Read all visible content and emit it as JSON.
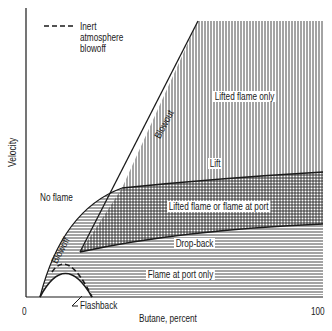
{
  "diagram": {
    "type": "stability-diagram",
    "x_axis": {
      "label": "Butane, percent",
      "min_label": "0",
      "max_label": "100"
    },
    "y_axis": {
      "label": "Velocity"
    },
    "legend": {
      "line_style": "dashed",
      "lines": [
        "Inert",
        "atmosphere",
        "blowoff"
      ]
    },
    "regions": {
      "lifted_only": "Lifted flame only",
      "lifted_or_port": "Lifted flame or flame at port",
      "port_only": "Flame at port only",
      "no_flame": "No flame"
    },
    "curves": {
      "blowout": "Blowout",
      "lift": "Lift",
      "drop_back": "Drop-back",
      "blowoff": "Blowoff",
      "flashback": "Flashback"
    },
    "colors": {
      "ink": "#1a1a1a",
      "background": "#ffffff"
    }
  }
}
